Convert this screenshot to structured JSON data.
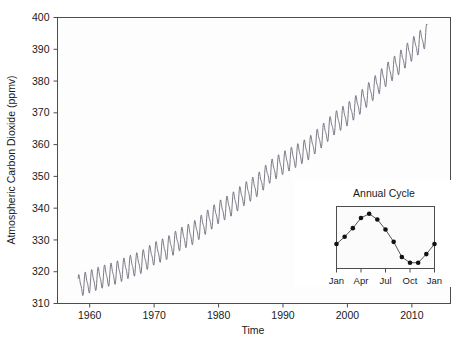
{
  "chart_data": {
    "type": "line",
    "title": "",
    "xlabel": "Time",
    "ylabel": "Atmospheric Carbon Dioxide (ppmv)",
    "xlim": [
      1955.0,
      1916.0
    ],
    "x_range": [
      1955,
      2016
    ],
    "ylim": [
      310,
      400
    ],
    "grid": false,
    "legend": "none",
    "line_color": "#6b6b78",
    "y_ticks": [
      310,
      320,
      330,
      340,
      350,
      360,
      370,
      380,
      390,
      400
    ],
    "x_ticks": [
      1960,
      1970,
      1980,
      1990,
      2000,
      2010
    ],
    "series": [
      {
        "name": "Monthly mean atmospheric CO2",
        "description": "Keeling curve: rising trend with seasonal sawtooth oscillation of about 6 ppmv peak-to-trough",
        "annual_trend_x": [
          1958,
          1960,
          1962,
          1964,
          1966,
          1968,
          1970,
          1972,
          1974,
          1976,
          1978,
          1980,
          1982,
          1984,
          1986,
          1988,
          1990,
          1992,
          1994,
          1996,
          1998,
          2000,
          2002,
          2004,
          2006,
          2008,
          2010,
          2012
        ],
        "annual_trend_y": [
          315.3,
          316.9,
          318.4,
          319.6,
          321.4,
          323.0,
          325.7,
          327.4,
          330.2,
          332.1,
          335.4,
          338.7,
          341.1,
          344.4,
          347.2,
          351.5,
          354.2,
          356.4,
          358.8,
          362.6,
          366.7,
          369.5,
          373.2,
          377.5,
          381.9,
          385.6,
          389.9,
          393.8
        ],
        "seasonal_amplitude_ppmv": 6.2,
        "seasonal_shape": "sawtooth_peak_May_trough_September"
      }
    ],
    "inset": {
      "type": "line",
      "title": "Annual Cycle",
      "xlabel": "",
      "ylabel": "",
      "marker": "filled-circle",
      "marker_color": "#111111",
      "line_color": "#555560",
      "x_tick_labels": [
        "Jan",
        "Apr",
        "Jul",
        "Oct",
        "Jan"
      ],
      "x_tick_positions": [
        0,
        3,
        6,
        9,
        12
      ],
      "categories": [
        "Jan",
        "Feb",
        "Mar",
        "Apr",
        "May",
        "Jun",
        "Jul",
        "Aug",
        "Sep",
        "Oct",
        "Nov",
        "Dec",
        "Jan"
      ],
      "values": [
        330.0,
        331.0,
        332.2,
        333.6,
        334.2,
        333.4,
        332.0,
        330.3,
        328.2,
        327.4,
        327.4,
        328.6,
        330.0
      ],
      "ylim": [
        326.6,
        335.2
      ],
      "grid": false,
      "legend": "none"
    }
  },
  "axes": {
    "y_title": "Atmospheric Carbon Dioxide (ppmv)",
    "x_title": "Time",
    "y_tick_labels": [
      "400",
      "390",
      "380",
      "370",
      "360",
      "350",
      "340",
      "330",
      "320",
      "310"
    ],
    "x_tick_labels": [
      "1960",
      "1970",
      "1980",
      "1990",
      "2000",
      "2010"
    ]
  },
  "inset_panel": {
    "title": "Annual Cycle",
    "x_tick_labels": [
      "Jan",
      "Apr",
      "Jul",
      "Oct",
      "Jan"
    ]
  },
  "colors": {
    "curve": "#6b6b78",
    "axis": "#4d4d4d",
    "text": "#1a1a1a",
    "inset_marker": "#111111",
    "background": "#ffffff"
  }
}
